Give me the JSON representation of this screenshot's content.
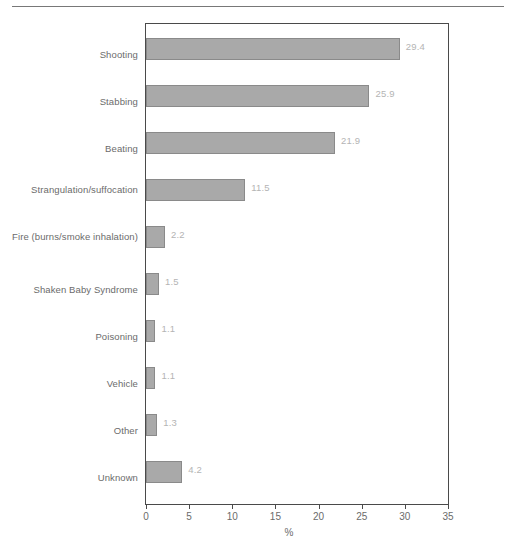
{
  "figure": {
    "clipped_title": "",
    "source_note": ""
  },
  "chart_data": {
    "type": "bar",
    "orientation": "horizontal",
    "title": "",
    "xlabel": "%",
    "ylabel": "",
    "xlim": [
      0,
      35
    ],
    "xticks": [
      0,
      5,
      10,
      15,
      20,
      25,
      30,
      35
    ],
    "grid": false,
    "legend": null,
    "bar_color": "#a9a9a9",
    "bar_edge_color": "#8a8a8a",
    "value_label_color": "#b4b4b4",
    "axis_color": "#4a4a4a",
    "text_color": "#6b6b6b",
    "categories": [
      "Shooting",
      "Stabbing",
      "Beating",
      "Strangulation/suffocation",
      "Fire (burns/smoke inhalation)",
      "Shaken Baby Syndrome",
      "Poisoning",
      "Vehicle",
      "Other",
      "Unknown"
    ],
    "values": [
      29.4,
      25.9,
      21.9,
      11.5,
      2.2,
      1.5,
      1.1,
      1.1,
      1.3,
      4.2
    ],
    "value_labels": [
      "29.4",
      "25.9",
      "21.9",
      "11.5",
      "2.2",
      "1.5",
      "1.1",
      "1.1",
      "1.3",
      "4.2"
    ],
    "xtick_labels": [
      "0",
      "5",
      "10",
      "15",
      "20",
      "25",
      "30",
      "35"
    ]
  }
}
